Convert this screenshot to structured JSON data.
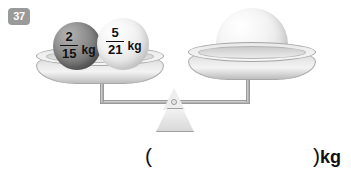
{
  "problem": {
    "number": "37"
  },
  "scale": {
    "left_pan": {
      "items": [
        {
          "name": "dark-sphere",
          "numerator": "2",
          "denominator": "15",
          "unit": "kg",
          "color": "#6f6f6f"
        },
        {
          "name": "light-sphere",
          "numerator": "5",
          "denominator": "21",
          "unit": "kg",
          "color": "#e8e8e8"
        }
      ]
    },
    "right_pan": {
      "items": [
        {
          "name": "large-sphere",
          "label": "",
          "color": "#e0e0e0"
        }
      ]
    },
    "fulcrum": {
      "name": "fulcrum"
    }
  },
  "answer": {
    "open_paren": "(",
    "close_paren": ")",
    "unit": "kg",
    "value": ""
  }
}
